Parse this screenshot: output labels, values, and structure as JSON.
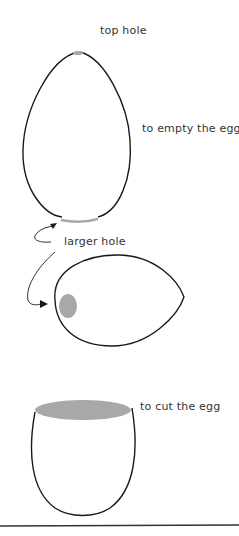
{
  "diagram": {
    "labels": {
      "top_hole": "top hole",
      "empty_egg": "to empty the egg",
      "larger_hole": "larger hole",
      "cut_egg": "to cut the egg"
    },
    "steps": [
      {
        "name": "upright-egg",
        "annotation": "top hole",
        "note": "to empty the egg"
      },
      {
        "name": "side-egg",
        "annotation": "larger hole"
      },
      {
        "name": "cut-egg-cup",
        "annotation": "to cut the egg"
      }
    ],
    "colors": {
      "outline": "#1a1a1a",
      "hole_fill": "#a8a8a8",
      "text": "#333333",
      "background": "#ffffff"
    }
  }
}
